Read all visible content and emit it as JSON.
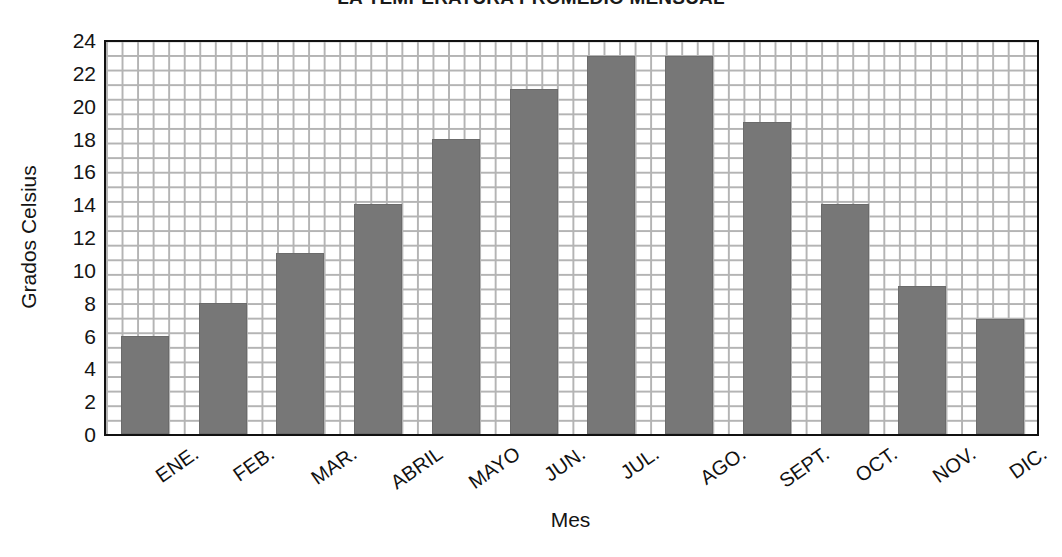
{
  "chart_data": {
    "type": "bar",
    "title": "LA TEMPERATURA PROMEDIO MENSUAL",
    "xlabel": "Mes",
    "ylabel": "Grados Celsius",
    "categories": [
      "ENE.",
      "FEB.",
      "MAR.",
      "ABRIL",
      "MAYO",
      "JUN.",
      "JUL.",
      "AGO.",
      "SEPT.",
      "OCT.",
      "NOV.",
      "DIC."
    ],
    "values": [
      6,
      8,
      11,
      14,
      18,
      21,
      23,
      23,
      19,
      14,
      9,
      7
    ],
    "ylim": [
      0,
      24
    ],
    "ytick_values": [
      0,
      2,
      4,
      6,
      8,
      10,
      12,
      14,
      16,
      18,
      20,
      22,
      24
    ],
    "ytick_labels": [
      "0",
      "2",
      "4",
      "6",
      "8",
      "10",
      "12",
      "14",
      "16",
      "18",
      "20",
      "22",
      "24"
    ],
    "grid": true,
    "legend": "none",
    "bar_color": "#777777",
    "grid_color": "#b4b4b4",
    "axis_color": "#111111",
    "background_color": "#ffffff"
  }
}
